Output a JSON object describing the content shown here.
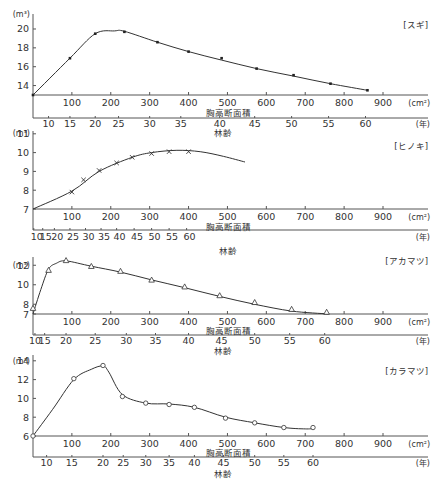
{
  "chart_data": [
    {
      "type": "line",
      "title": "[スギ]",
      "ylabel": "(m³)",
      "xlabel": "胸高断面積",
      "xlabel_unit": "(cm²)",
      "x2label": "林齢",
      "x2label_unit": "(年)",
      "ylim": [
        13,
        20.5
      ],
      "yticks": [
        14,
        16,
        18,
        20
      ],
      "xlim": [
        0,
        950
      ],
      "xticks": [
        100,
        200,
        300,
        400,
        500,
        600,
        700,
        800,
        900
      ],
      "age_ticks": [
        {
          "age": 10,
          "x": 40
        },
        {
          "age": 15,
          "x": 95
        },
        {
          "age": 20,
          "x": 160
        },
        {
          "age": 25,
          "x": 220
        },
        {
          "age": 30,
          "x": 300
        },
        {
          "age": 35,
          "x": 380
        },
        {
          "age": 40,
          "x": 480
        },
        {
          "age": 45,
          "x": 570
        },
        {
          "age": 50,
          "x": 665
        },
        {
          "age": 55,
          "x": 760
        },
        {
          "age": 60,
          "x": 855
        }
      ],
      "marker": "dot",
      "points": [
        [
          0,
          13.0
        ],
        [
          95,
          16.9
        ],
        [
          160,
          19.5
        ],
        [
          235,
          19.7
        ],
        [
          320,
          18.6
        ],
        [
          400,
          17.6
        ],
        [
          485,
          16.9
        ],
        [
          575,
          15.8
        ],
        [
          670,
          15.1
        ],
        [
          765,
          14.2
        ],
        [
          860,
          13.5
        ]
      ],
      "curve": [
        [
          0,
          13.0
        ],
        [
          95,
          16.9
        ],
        [
          160,
          19.5
        ],
        [
          210,
          19.8
        ],
        [
          235,
          19.75
        ],
        [
          320,
          18.6
        ],
        [
          400,
          17.6
        ],
        [
          485,
          16.7
        ],
        [
          575,
          15.8
        ],
        [
          670,
          15.0
        ],
        [
          765,
          14.2
        ],
        [
          860,
          13.5
        ]
      ]
    },
    {
      "type": "line",
      "title": "[ヒノキ]",
      "ylabel": "(m³)",
      "xlabel": "胸高断面積",
      "xlabel_unit": "(cm²)",
      "x2label": "林齢",
      "x2label_unit": "(年)",
      "ylim": [
        7,
        11
      ],
      "yticks": [
        7,
        8,
        9,
        10,
        11
      ],
      "xlim": [
        0,
        950
      ],
      "xticks": [
        100,
        200,
        300,
        400,
        500,
        600,
        700,
        800,
        900
      ],
      "age_ticks": [
        {
          "age": 10,
          "x": 2
        },
        {
          "age": 15,
          "x": 25
        },
        {
          "age": 20,
          "x": 55
        },
        {
          "age": 25,
          "x": 95
        },
        {
          "age": 30,
          "x": 135
        },
        {
          "age": 35,
          "x": 175
        },
        {
          "age": 40,
          "x": 215
        },
        {
          "age": 45,
          "x": 260
        },
        {
          "age": 50,
          "x": 305
        },
        {
          "age": 55,
          "x": 350
        },
        {
          "age": 60,
          "x": 395
        }
      ],
      "marker": "x",
      "points": [
        [
          100,
          7.9
        ],
        [
          130,
          8.55
        ],
        [
          170,
          9.05
        ],
        [
          215,
          9.45
        ],
        [
          255,
          9.75
        ],
        [
          305,
          9.95
        ],
        [
          350,
          10.05
        ],
        [
          400,
          10.05
        ]
      ],
      "curve": [
        [
          0,
          7.0
        ],
        [
          100,
          7.95
        ],
        [
          170,
          9.0
        ],
        [
          255,
          9.75
        ],
        [
          305,
          10.0
        ],
        [
          370,
          10.12
        ],
        [
          430,
          10.05
        ],
        [
          490,
          9.8
        ],
        [
          545,
          9.5
        ]
      ]
    },
    {
      "type": "line",
      "title": "[アカマツ]",
      "ylabel": "(m³)",
      "xlabel": "胸高断面積",
      "xlabel_unit": "(cm²)",
      "x2label": "林齢",
      "x2label_unit": "(年)",
      "ylim": [
        7,
        12.8
      ],
      "yticks": [
        7,
        8,
        10,
        12
      ],
      "xlim": [
        0,
        950
      ],
      "xticks": [
        100,
        200,
        300,
        400,
        500,
        600,
        700,
        800,
        900
      ],
      "age_ticks": [
        {
          "age": 10,
          "x": 5
        },
        {
          "age": 15,
          "x": 30
        },
        {
          "age": 20,
          "x": 85
        },
        {
          "age": 25,
          "x": 160
        },
        {
          "age": 30,
          "x": 240
        },
        {
          "age": 35,
          "x": 315
        },
        {
          "age": 40,
          "x": 400
        },
        {
          "age": 45,
          "x": 485
        },
        {
          "age": 50,
          "x": 570
        },
        {
          "age": 55,
          "x": 660
        },
        {
          "age": 60,
          "x": 750
        }
      ],
      "marker": "triangle",
      "points": [
        [
          0,
          7.6
        ],
        [
          40,
          11.5
        ],
        [
          85,
          12.5
        ],
        [
          150,
          11.9
        ],
        [
          225,
          11.4
        ],
        [
          305,
          10.5
        ],
        [
          390,
          9.8
        ],
        [
          480,
          8.9
        ],
        [
          570,
          8.2
        ],
        [
          665,
          7.5
        ],
        [
          755,
          7.2
        ]
      ],
      "curve": [
        [
          0,
          7.0
        ],
        [
          20,
          9.5
        ],
        [
          40,
          11.6
        ],
        [
          60,
          12.2
        ],
        [
          85,
          12.45
        ],
        [
          150,
          11.9
        ],
        [
          225,
          11.3
        ],
        [
          305,
          10.5
        ],
        [
          390,
          9.7
        ],
        [
          480,
          8.8
        ],
        [
          570,
          8.0
        ],
        [
          665,
          7.3
        ],
        [
          760,
          7.0
        ]
      ]
    },
    {
      "type": "line",
      "title": "[カラマツ]",
      "ylabel": "(m³)",
      "xlabel": "胸高断面積",
      "xlabel_unit": "(cm²)",
      "x2label": "林齢",
      "x2label_unit": "(年)",
      "ylim": [
        6,
        14.5
      ],
      "yticks": [
        6,
        8,
        10,
        12,
        14
      ],
      "xlim": [
        0,
        950
      ],
      "xticks": [
        100,
        200,
        300,
        400,
        500,
        600,
        700,
        800,
        900
      ],
      "age_ticks": [
        {
          "age": 10,
          "x": 35
        },
        {
          "age": 15,
          "x": 100
        },
        {
          "age": 20,
          "x": 180
        },
        {
          "age": 25,
          "x": 232
        },
        {
          "age": 30,
          "x": 290
        },
        {
          "age": 35,
          "x": 350
        },
        {
          "age": 40,
          "x": 415
        },
        {
          "age": 45,
          "x": 490
        },
        {
          "age": 50,
          "x": 570
        },
        {
          "age": 55,
          "x": 645
        },
        {
          "age": 60,
          "x": 720
        }
      ],
      "marker": "circle",
      "points": [
        [
          0,
          6.0
        ],
        [
          105,
          12.1
        ],
        [
          180,
          13.5
        ],
        [
          230,
          10.2
        ],
        [
          290,
          9.5
        ],
        [
          350,
          9.35
        ],
        [
          415,
          9.05
        ],
        [
          495,
          7.9
        ],
        [
          570,
          7.4
        ],
        [
          645,
          6.9
        ],
        [
          720,
          6.9
        ]
      ],
      "curve": [
        [
          0,
          6.0
        ],
        [
          50,
          8.8
        ],
        [
          105,
          12.0
        ],
        [
          150,
          13.1
        ],
        [
          180,
          13.45
        ],
        [
          195,
          12.8
        ],
        [
          230,
          10.4
        ],
        [
          290,
          9.5
        ],
        [
          350,
          9.4
        ],
        [
          415,
          9.05
        ],
        [
          495,
          8.0
        ],
        [
          570,
          7.4
        ],
        [
          645,
          6.9
        ],
        [
          700,
          6.75
        ],
        [
          720,
          6.8
        ]
      ]
    }
  ]
}
